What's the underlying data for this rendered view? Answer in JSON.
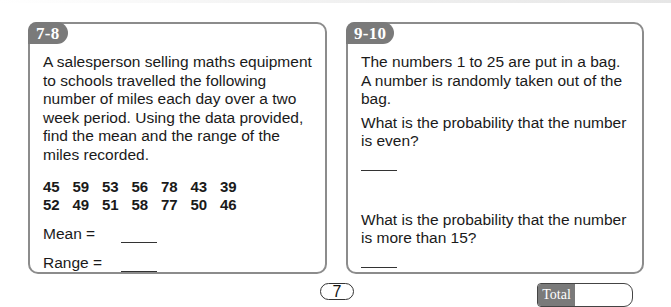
{
  "page": {
    "page_number": "7",
    "total_label": "Total",
    "colors": {
      "badge_bg": "#7a7a7a",
      "card_border": "#8c8c8c",
      "text": "#1a1a1a"
    }
  },
  "questions": [
    {
      "badge": "7-8",
      "paragraph": "A salesperson selling maths equipment to schools travelled the following number of miles each day over a two week period. Using the data provided, find the mean and the range of the miles recorded.",
      "data_rows": [
        [
          "45",
          "59",
          "53",
          "56",
          "78",
          "43",
          "39"
        ],
        [
          "52",
          "49",
          "51",
          "58",
          "77",
          "50",
          "46"
        ]
      ],
      "answers": [
        {
          "label": "Mean =",
          "value": ""
        },
        {
          "label": "Range =",
          "value": ""
        }
      ]
    },
    {
      "badge": "9-10",
      "intro_line1": "The numbers 1 to 25 are put in a bag.",
      "intro_line2": "A number is randomly taken out of the bag.",
      "sub_questions": [
        {
          "text": "What is the probability that the number is even?",
          "answer": ""
        },
        {
          "text": "What is the probability that the number is more than 15?",
          "answer": ""
        }
      ]
    }
  ]
}
